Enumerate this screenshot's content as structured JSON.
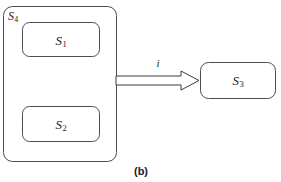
{
  "figure": {
    "caption": "(b)",
    "caption_x": 141,
    "caption_y": 171,
    "width": 281,
    "height": 182,
    "background_color": "#ffffff",
    "stroke_color": "#4d4d4d",
    "text_color": "#1a1a1a"
  },
  "container": {
    "name": "outer-system-container",
    "label_text": "S",
    "label_subscript": "4",
    "label_x": 8,
    "label_y": 10,
    "rect": {
      "x": 3.5,
      "y": 6.5,
      "width": 113,
      "height": 155,
      "rx": 9
    }
  },
  "nodes": [
    {
      "id": "s1",
      "label_text": "S",
      "label_subscript": "1",
      "center_x": 61,
      "center_y": 40,
      "rect": {
        "x": 22.5,
        "y": 22.5,
        "width": 77,
        "height": 34,
        "rx": 7
      }
    },
    {
      "id": "s2",
      "label_text": "S",
      "label_subscript": "2",
      "center_x": 61,
      "center_y": 124,
      "rect": {
        "x": 22.5,
        "y": 106.5,
        "width": 77,
        "height": 35,
        "rx": 7
      }
    },
    {
      "id": "s3",
      "label_text": "S",
      "label_subscript": "3",
      "center_x": 238,
      "center_y": 80,
      "rect": {
        "x": 200.5,
        "y": 62.5,
        "width": 75,
        "height": 36,
        "rx": 8
      }
    }
  ],
  "edges": [
    {
      "id": "edge-i",
      "label_text": "i",
      "label_x": 158,
      "label_y": 63,
      "from": "outer-system-container",
      "to": "s3",
      "style": "hollow-block-arrow",
      "shaft_points": "116,76 181,76 181,71 199,80.5 181,90 181,85 116,85",
      "start_x": 116,
      "end_x": 199,
      "center_y": 80.5
    }
  ]
}
